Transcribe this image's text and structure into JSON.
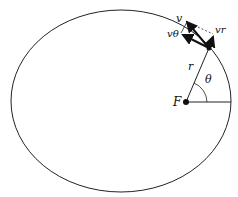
{
  "diagram": {
    "labels": {
      "v": "v",
      "v_theta": "vθ",
      "v_r": "vr",
      "r": "r",
      "theta": "θ",
      "focus": "F"
    },
    "colors": {
      "stroke": "#222222",
      "background": "#ffffff"
    }
  }
}
